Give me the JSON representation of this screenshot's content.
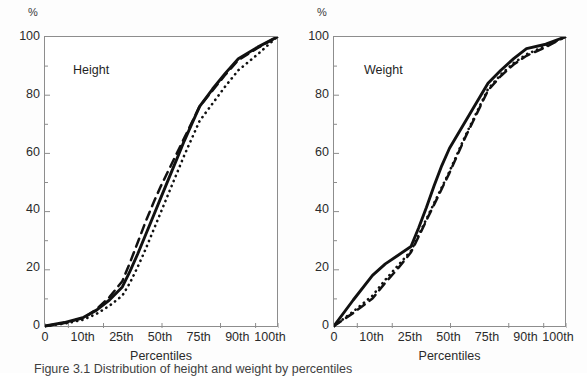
{
  "figure": {
    "caption_partial": "Figure 3.1   Distribution of height and weight by percentiles",
    "background": "#ffffff",
    "ink_color": "#111111",
    "axis_color": "#8d8d8d"
  },
  "chart_data": [
    {
      "type": "line",
      "title": "Height",
      "xlabel": "Percentiles",
      "ylabel": "%",
      "ylim": [
        0,
        100
      ],
      "yticks": [
        0,
        20,
        40,
        60,
        80,
        100
      ],
      "yticks_minor": [
        10,
        30,
        50,
        70,
        90
      ],
      "grid": false,
      "legend": "none",
      "categories": [
        "0",
        "10th",
        "25th",
        "50th",
        "75th",
        "90th",
        "100th"
      ],
      "x": [
        0,
        10,
        25,
        50,
        75,
        90,
        100
      ],
      "series": [
        {
          "name": "solid",
          "style": "solid",
          "x": [
            0,
            5,
            10,
            15,
            20,
            25,
            30,
            35,
            40,
            45,
            50,
            55,
            60,
            65,
            70,
            75,
            80,
            85,
            90,
            95,
            100
          ],
          "values": [
            0,
            1.2,
            3.0,
            5.5,
            9.0,
            13.5,
            19.0,
            25.0,
            31.5,
            38.0,
            44.5,
            51.0,
            57.5,
            64.0,
            70.0,
            76.0,
            82.0,
            87.5,
            92.5,
            96.5,
            100
          ]
        },
        {
          "name": "dashed",
          "style": "dashed",
          "x": [
            0,
            5,
            10,
            15,
            20,
            25,
            30,
            35,
            40,
            45,
            50,
            55,
            60,
            65,
            70,
            75,
            80,
            85,
            90,
            95,
            100
          ],
          "values": [
            0,
            1.0,
            2.8,
            5.8,
            10.0,
            15.5,
            22.0,
            29.0,
            36.0,
            42.5,
            48.5,
            54.0,
            59.5,
            65.0,
            70.5,
            76.0,
            81.5,
            87.0,
            92.0,
            96.2,
            100
          ]
        },
        {
          "name": "dotted",
          "style": "dotted",
          "x": [
            0,
            5,
            10,
            15,
            20,
            25,
            30,
            35,
            40,
            45,
            50,
            55,
            60,
            65,
            70,
            75,
            80,
            85,
            90,
            95,
            100
          ],
          "values": [
            0,
            0.8,
            2.2,
            4.2,
            7.0,
            10.5,
            15.0,
            20.5,
            26.5,
            33.0,
            39.5,
            46.0,
            52.5,
            59.0,
            65.0,
            71.0,
            77.0,
            83.0,
            88.5,
            94.0,
            100
          ]
        }
      ]
    },
    {
      "type": "line",
      "title": "Weight",
      "xlabel": "Percentiles",
      "ylabel": "%",
      "ylim": [
        0,
        100
      ],
      "yticks": [
        0,
        20,
        40,
        60,
        80,
        100
      ],
      "yticks_minor": [
        10,
        30,
        50,
        70,
        90
      ],
      "grid": false,
      "legend": "none",
      "categories": [
        "0",
        "10th",
        "25th",
        "50th",
        "75th",
        "90th",
        "100th"
      ],
      "x": [
        0,
        10,
        25,
        50,
        75,
        90,
        100
      ],
      "series": [
        {
          "name": "solid",
          "style": "solid",
          "x": [
            0,
            5,
            10,
            15,
            20,
            25,
            30,
            35,
            40,
            45,
            50,
            55,
            60,
            65,
            70,
            75,
            80,
            85,
            90,
            95,
            100
          ],
          "values": [
            0,
            9.0,
            17.5,
            21.5,
            24.5,
            27.5,
            34.0,
            41.0,
            48.5,
            55.5,
            61.5,
            66.0,
            70.5,
            75.0,
            79.5,
            84.0,
            88.5,
            92.5,
            96.0,
            97.5,
            100
          ]
        },
        {
          "name": "dashed",
          "style": "dashed",
          "x": [
            0,
            5,
            10,
            15,
            20,
            25,
            30,
            35,
            40,
            45,
            50,
            55,
            60,
            65,
            70,
            75,
            80,
            85,
            90,
            95,
            100
          ],
          "values": [
            0,
            4.5,
            9.5,
            15.0,
            20.0,
            25.5,
            31.0,
            36.5,
            42.0,
            47.5,
            53.0,
            59.0,
            65.0,
            70.5,
            76.0,
            81.5,
            86.5,
            90.5,
            93.5,
            96.5,
            100
          ]
        },
        {
          "name": "dotted",
          "style": "dotted",
          "x": [
            0,
            5,
            10,
            15,
            20,
            25,
            30,
            35,
            40,
            45,
            50,
            55,
            60,
            65,
            70,
            75,
            80,
            85,
            90,
            95,
            100
          ],
          "values": [
            0,
            5.0,
            10.5,
            16.0,
            21.0,
            26.0,
            31.5,
            37.0,
            42.5,
            48.0,
            53.5,
            59.5,
            65.5,
            71.0,
            76.5,
            82.0,
            87.0,
            91.0,
            94.0,
            97.0,
            100
          ]
        }
      ]
    }
  ]
}
